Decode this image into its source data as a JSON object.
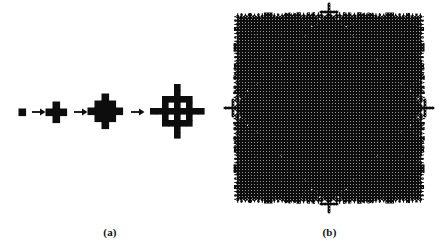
{
  "figure": {
    "background_color": "#ffffff",
    "ink_color": "#0d0d0d",
    "width": 439,
    "height": 248
  },
  "panels": [
    {
      "id": "a",
      "caption": "(a)",
      "description": "Four successive iterations of a cross-shaped (Vicsek) fractal growth, connected left-to-right by arrows.",
      "arrow_glyph": "arrow-right-icon",
      "arrow_count": 3,
      "stages": [
        {
          "index": 1,
          "grid": 1,
          "cell_px": 7,
          "center_x": 22,
          "center_y": 112,
          "label": "seed-square"
        },
        {
          "index": 2,
          "grid": 3,
          "cell_px": 7,
          "center_x": 56,
          "center_y": 112,
          "label": "cross-iteration-1"
        },
        {
          "index": 3,
          "grid": 5,
          "cell_px": 7,
          "center_x": 105,
          "center_y": 111,
          "label": "cross-iteration-2"
        },
        {
          "index": 4,
          "grid": 9,
          "cell_px": 6,
          "center_x": 177,
          "center_y": 111,
          "label": "cross-iteration-3"
        }
      ],
      "arrows": [
        {
          "index": 1,
          "x": 32,
          "y": 112
        },
        {
          "index": 2,
          "x": 74,
          "y": 112
        },
        {
          "index": 3,
          "x": 131,
          "y": 112
        }
      ]
    },
    {
      "id": "b",
      "caption": "(b)",
      "description": "Large diamond-shaped fractal aggregate with recursive cross-shaped decorations along its perimeter and a dithered halftone interior.",
      "center_x": 329,
      "center_y": 108,
      "radius": 96,
      "orientation_degrees": 45,
      "recursion_levels": 4,
      "texture": "halftone-dither"
    }
  ],
  "chart_data": {
    "type": "diagram",
    "title": "",
    "series": [
      {
        "name": "Vicsek cross iterations",
        "panel": "a",
        "orders": [
          0,
          1,
          2,
          3
        ],
        "linear_sizes": [
          1,
          3,
          5,
          9
        ],
        "cell_counts": [
          1,
          5,
          13,
          41
        ],
        "arrow_labels": [
          "→",
          "→",
          "→"
        ]
      },
      {
        "name": "Diamond fractal aggregate",
        "panel": "b",
        "recursion_levels": 4,
        "branch_scale": 0.5,
        "shape": "rotated-square-with-cross-decorations"
      }
    ],
    "xlabel": "",
    "ylabel": "",
    "legend": []
  }
}
